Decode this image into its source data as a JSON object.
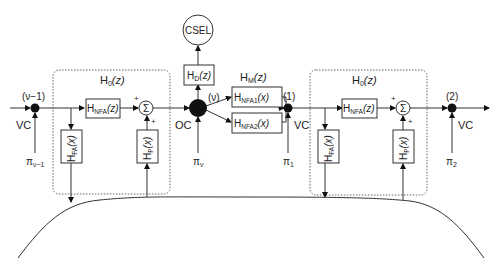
{
  "diagram": {
    "type": "signal-flow block diagram",
    "nodes": {
      "prev": {
        "label": "(ν−1)",
        "side_label": "VC",
        "input": "π",
        "input_sub": "ν−1"
      },
      "oc": {
        "label": "(ν)",
        "side_label": "OC",
        "input": "π",
        "input_sub": "ν"
      },
      "n1": {
        "label": "(1)",
        "side_label": "VC",
        "input": "π",
        "input_sub": "1"
      },
      "n2": {
        "label": "(2)",
        "side_label": "VC",
        "input": "π",
        "input_sub": "2"
      }
    },
    "groups": {
      "left_h0": {
        "title": "H",
        "title_sub": "0",
        "title_arg": "(z)"
      },
      "right_h0": {
        "title": "H",
        "title_sub": "0",
        "title_arg": "(z)"
      },
      "hm": {
        "title": "H",
        "title_sub": "M",
        "title_arg": "(z)"
      }
    },
    "blocks": {
      "hnfa_left": {
        "base": "H",
        "sub": "NFA",
        "arg": "(z)"
      },
      "hnfa_right": {
        "base": "H",
        "sub": "NFA",
        "arg": "(z)"
      },
      "hfa_left": {
        "base": "H",
        "sub": "FA",
        "arg": "(x)"
      },
      "hfa_right": {
        "base": "H",
        "sub": "FA",
        "arg": "(x)"
      },
      "hp_left": {
        "base": "H",
        "sub": "P",
        "arg": "(x)"
      },
      "hp_right": {
        "base": "H",
        "sub": "P",
        "arg": "(x)"
      },
      "hd": {
        "base": "H",
        "sub": "D",
        "arg": "(z)"
      },
      "hnfa1": {
        "base": "H",
        "sub": "NFA1",
        "arg": "(x)"
      },
      "hnfa2": {
        "base": "H",
        "sub": "NFA2",
        "arg": "(x)"
      },
      "csel": {
        "label": "CSEL"
      }
    },
    "summers": {
      "left": {
        "symbol": "Σ",
        "in_top": "+",
        "in_bottom": "+"
      },
      "right": {
        "symbol": "Σ",
        "in_top": "+",
        "in_bottom": "+"
      }
    }
  }
}
